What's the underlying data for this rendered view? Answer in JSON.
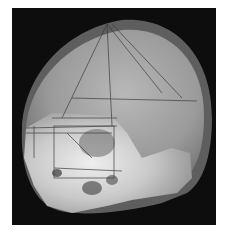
{
  "image": {
    "description": "3D rendering of a human skull (lateral-oblique view) with a wireframe pyramid and box overlay",
    "background_color": "#0d0d0d",
    "page_color": "#ffffff",
    "colors": {
      "skull_halo": "#5e5e5e",
      "skull_cranium": "#a8a8a8",
      "skull_face": "#d8d8d8",
      "wireframe": "#3a3a3a"
    }
  }
}
